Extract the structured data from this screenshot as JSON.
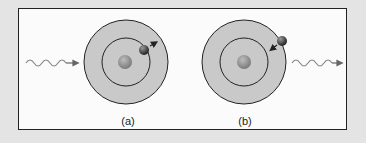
{
  "diagram": {
    "panels": [
      {
        "label": "(a)",
        "description": "photon absorbed, electron moves to outer orbit",
        "arrow_direction": "outward"
      },
      {
        "label": "(b)",
        "description": "electron drops to inner orbit, photon emitted",
        "arrow_direction": "inward"
      }
    ],
    "colors": {
      "outer_orbit_fill": "#c9c9c9",
      "orbit_stroke": "#222222",
      "nucleus": "#8a8a8a",
      "electron": "#3a3a3a",
      "photon_wave": "#888888",
      "frame_bg": "#fbfbfb",
      "page_bg": "#e4e4e4"
    }
  }
}
